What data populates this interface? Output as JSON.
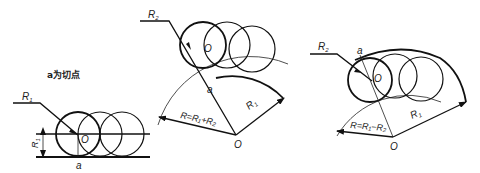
{
  "figures": [
    {
      "id": "tangent-to-line",
      "caption": "a为切点",
      "labels": {
        "radius_leader": "R",
        "radius_leader_sub": "1",
        "center": "O",
        "tangent_point": "a",
        "offset_dim": "R",
        "offset_dim_sub": "1"
      }
    },
    {
      "id": "external-tangent-to-arc",
      "labels": {
        "radius_leader": "R",
        "radius_leader_sub": "2",
        "center_small": "O",
        "tangent_point": "a",
        "arc_radius": "R",
        "arc_radius_sub": "1",
        "formula": "R=R₁+R₂",
        "center_large": "O"
      }
    },
    {
      "id": "internal-tangent-to-arc",
      "labels": {
        "radius_leader": "R",
        "radius_leader_sub": "2",
        "tangent_point": "a",
        "center_small": "O",
        "arc_radius": "R",
        "arc_radius_sub": "1",
        "formula": "R=R₁−R₂",
        "center_large": "O"
      }
    }
  ],
  "colors": {
    "ink": "#111111",
    "background": "#ffffff"
  }
}
